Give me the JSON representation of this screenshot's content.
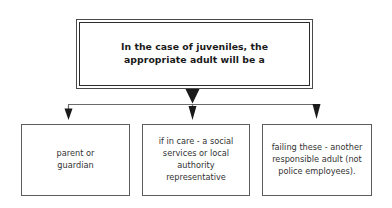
{
  "diagram": {
    "type": "flowchart",
    "orientation": "top-down",
    "title_box": {
      "text": "In the case of juveniles, the\nappropriate adult will be a",
      "border_style": "double",
      "border_color": "#2b2b2b",
      "text_color": "#1a1a1a",
      "bold": true
    },
    "connectors": {
      "line_color": "#6b6b6b",
      "arrow_color": "#1a1a1a",
      "main_arrow_name": "main-down-arrow",
      "branch_count": 3
    },
    "outcomes": [
      {
        "id": "outcome-parent-or-guardian",
        "text": "parent or\nguardian"
      },
      {
        "id": "outcome-social-services",
        "text": "if in care - a social\nservices or local\nauthority\nrepresentative"
      },
      {
        "id": "outcome-responsible-adult",
        "text": "failing these - another\nresponsible adult (not\npolice employees)."
      }
    ],
    "colors": {
      "background": "#ffffff",
      "box_border": "#5c5c5c",
      "text": "#333333"
    }
  }
}
